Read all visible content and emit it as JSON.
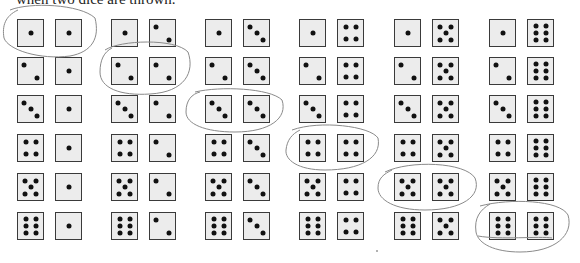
{
  "caption": "when two dice are thrown.",
  "layout": {
    "row_tops": [
      19,
      57,
      95,
      134,
      173,
      212
    ],
    "group_lefts": [
      17,
      111,
      205,
      299,
      394,
      489
    ],
    "second_die_offset": 38
  },
  "grid": {
    "description": "Sample space of two dice: row = first die value, column = second die value",
    "rows": [
      [
        [
          1,
          1
        ],
        [
          1,
          2
        ],
        [
          1,
          3
        ],
        [
          1,
          4
        ],
        [
          1,
          5
        ],
        [
          1,
          6
        ]
      ],
      [
        [
          2,
          1
        ],
        [
          2,
          2
        ],
        [
          2,
          3
        ],
        [
          2,
          4
        ],
        [
          2,
          5
        ],
        [
          2,
          6
        ]
      ],
      [
        [
          3,
          1
        ],
        [
          3,
          2
        ],
        [
          3,
          3
        ],
        [
          3,
          4
        ],
        [
          3,
          5
        ],
        [
          3,
          6
        ]
      ],
      [
        [
          4,
          1
        ],
        [
          4,
          2
        ],
        [
          4,
          3
        ],
        [
          4,
          4
        ],
        [
          4,
          5
        ],
        [
          4,
          6
        ]
      ],
      [
        [
          5,
          1
        ],
        [
          5,
          2
        ],
        [
          5,
          3
        ],
        [
          5,
          4
        ],
        [
          5,
          5
        ],
        [
          5,
          6
        ]
      ],
      [
        [
          6,
          1
        ],
        [
          6,
          2
        ],
        [
          6,
          3
        ],
        [
          6,
          4
        ],
        [
          6,
          5
        ],
        [
          6,
          6
        ]
      ]
    ],
    "circled_pairs": [
      [
        1,
        1
      ],
      [
        2,
        2
      ],
      [
        3,
        3
      ],
      [
        4,
        4
      ],
      [
        5,
        5
      ],
      [
        6,
        6
      ]
    ]
  },
  "colors": {
    "die_face": "#ececec",
    "die_border": "#3a3a3a",
    "pip": "#111111",
    "pencil": "#8a8a8a"
  }
}
